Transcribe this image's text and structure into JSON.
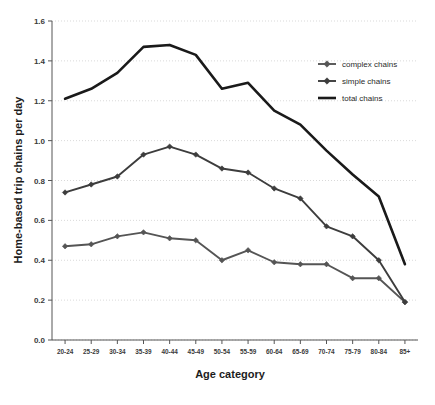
{
  "chart_data": {
    "type": "line",
    "title": "",
    "xlabel": "Age category",
    "ylabel": "Home-based trip chains per day",
    "categories": [
      "20-24",
      "25-29",
      "30-34",
      "35-39",
      "40-44",
      "45-49",
      "50-54",
      "55-59",
      "60-64",
      "65-69",
      "70-74",
      "75-79",
      "80-84",
      "85+"
    ],
    "ylim": [
      0.0,
      1.6
    ],
    "ytick_labels": [
      "0.0",
      "0.2",
      "0.4",
      "0.6",
      "0.8",
      "1.0",
      "1.2",
      "1.4",
      "1.6"
    ],
    "ytick_values": [
      0.0,
      0.2,
      0.4,
      0.6,
      0.8,
      1.0,
      1.2,
      1.4,
      1.6
    ],
    "grid": true,
    "legend_position": "right-top",
    "series": [
      {
        "name": "complex chains",
        "marker": "diamond",
        "color": "#555555",
        "values": [
          0.47,
          0.48,
          0.52,
          0.54,
          0.51,
          0.5,
          0.4,
          0.45,
          0.39,
          0.38,
          0.38,
          0.31,
          0.31,
          0.19
        ]
      },
      {
        "name": "simple chains",
        "marker": "diamond",
        "color": "#3d3d3d",
        "values": [
          0.74,
          0.78,
          0.82,
          0.93,
          0.97,
          0.93,
          0.86,
          0.84,
          0.76,
          0.71,
          0.57,
          0.52,
          0.4,
          0.19
        ]
      },
      {
        "name": "total chains",
        "marker": "none",
        "color": "#1a1a1a",
        "values": [
          1.21,
          1.26,
          1.34,
          1.47,
          1.48,
          1.43,
          1.26,
          1.29,
          1.15,
          1.08,
          0.95,
          0.83,
          0.72,
          0.38
        ]
      }
    ]
  },
  "legend": {
    "items": [
      {
        "label": "complex chains"
      },
      {
        "label": "simple chains"
      },
      {
        "label": "total chains"
      }
    ]
  },
  "axes": {
    "x_title": "Age category",
    "y_title": "Home-based trip chains per day"
  }
}
